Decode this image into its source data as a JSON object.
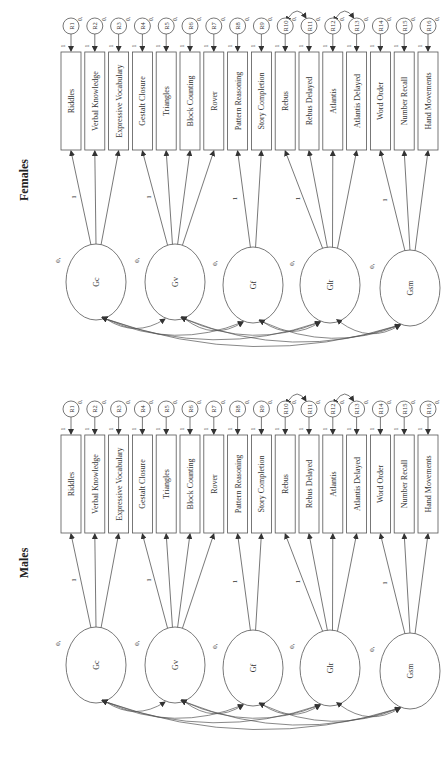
{
  "figure": {
    "orientation": "rotated -90deg",
    "line_color": "#555555",
    "text_color": "#333333"
  },
  "panels": [
    {
      "title": "Females",
      "factors": [
        {
          "name": "Gc",
          "mean_label": "0,",
          "indicators": [
            0,
            1,
            2
          ],
          "fixed_loading": "1"
        },
        {
          "name": "Gv",
          "mean_label": "0,",
          "indicators": [
            3,
            4,
            5,
            6
          ],
          "fixed_loading": "1"
        },
        {
          "name": "Gf",
          "mean_label": "0,",
          "indicators": [
            7,
            8
          ],
          "fixed_loading": "1"
        },
        {
          "name": "Glr",
          "mean_label": "0,",
          "indicators": [
            9,
            10,
            11,
            12
          ],
          "fixed_loading": "1"
        },
        {
          "name": "Gsm",
          "mean_label": "0,",
          "indicators": [
            13,
            14,
            15
          ],
          "fixed_loading": "1"
        }
      ],
      "indicators": [
        "Riddles",
        "Verbal Knowledge",
        "Expressive Vocabulary",
        "Gestalt Closure",
        "Triangles",
        "Block Counting",
        "Rover",
        "Pattern Reasoning",
        "Story Completion",
        "Rebus",
        "Rebus Delayed",
        "Atlantis",
        "Atlantis Delayed",
        "Word Order",
        "Number Recall",
        "Hand Movements"
      ],
      "residuals": [
        "R1",
        "R2",
        "R3",
        "R4",
        "R5",
        "R6",
        "R7",
        "R8",
        "R9",
        "R10",
        "R11",
        "R12",
        "R13",
        "R14",
        "R15",
        "R16"
      ],
      "residual_mean_label": "0,",
      "residual_path_label": "1",
      "residual_covariances": [
        [
          9,
          10
        ],
        [
          11,
          12
        ]
      ]
    },
    {
      "title": "Males",
      "factors": [
        {
          "name": "Gc",
          "mean_label": "0,",
          "indicators": [
            0,
            1,
            2
          ],
          "fixed_loading": "1"
        },
        {
          "name": "Gv",
          "mean_label": "0,",
          "indicators": [
            3,
            4,
            5,
            6
          ],
          "fixed_loading": "1"
        },
        {
          "name": "Gf",
          "mean_label": "0,",
          "indicators": [
            7,
            8
          ],
          "fixed_loading": "1"
        },
        {
          "name": "Glr",
          "mean_label": "0,",
          "indicators": [
            9,
            10,
            11,
            12
          ],
          "fixed_loading": "1"
        },
        {
          "name": "Gsm",
          "mean_label": "0,",
          "indicators": [
            13,
            14,
            15
          ],
          "fixed_loading": "1"
        }
      ],
      "indicators": [
        "Riddles",
        "Verbal Knowledge",
        "Expressive Vocabulary",
        "Gestalt Closure",
        "Triangles",
        "Block Counting",
        "Rover",
        "Pattern Reasoning",
        "Story Completion",
        "Rebus",
        "Rebus Delayed",
        "Atlantis",
        "Atlantis Delayed",
        "Word Order",
        "Number Recall",
        "Hand Movements"
      ],
      "residuals": [
        "R1",
        "R2",
        "R3",
        "R4",
        "R5",
        "R6",
        "R7",
        "R8",
        "R9",
        "R10",
        "R11",
        "R12",
        "R13",
        "R14",
        "R15",
        "R16"
      ],
      "residual_mean_label": "0,",
      "residual_path_label": "1",
      "residual_covariances": [
        [
          9,
          10
        ],
        [
          11,
          12
        ]
      ]
    }
  ]
}
